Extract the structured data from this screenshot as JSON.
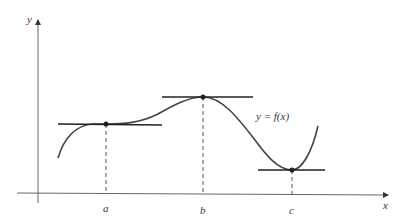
{
  "figure": {
    "axes": {
      "x_label": "x",
      "y_label": "y"
    },
    "curve_label": "y = f(x)",
    "critical_points": [
      {
        "label": "a",
        "type": "horizontal tangent (inflection)"
      },
      {
        "label": "b",
        "type": "local maximum"
      },
      {
        "label": "c",
        "type": "local minimum"
      }
    ],
    "colors": {
      "axis": "#555555",
      "curve": "#444444",
      "tangent": "#222222",
      "dashed": "#555555",
      "background": "#ffffff"
    }
  }
}
